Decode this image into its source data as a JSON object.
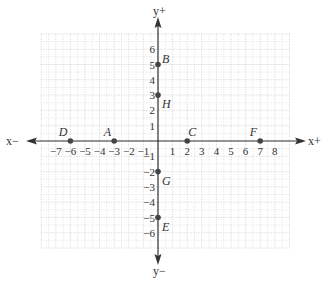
{
  "chart_data": {
    "type": "scatter",
    "title": "",
    "xlabel_pos": "x+",
    "xlabel_neg": "x−",
    "ylabel_pos": "y+",
    "ylabel_neg": "y−",
    "xlim": [
      -8,
      9
    ],
    "ylim": [
      -7,
      7
    ],
    "grid": true,
    "x_ticks": [
      -7,
      -6,
      -5,
      -4,
      -3,
      -2,
      -1,
      1,
      2,
      3,
      4,
      5,
      6,
      7,
      8
    ],
    "y_ticks": [
      -6,
      -5,
      -4,
      -3,
      -2,
      -1,
      1,
      2,
      3,
      4,
      5,
      6
    ],
    "points": [
      {
        "label": "A",
        "x": -3,
        "y": 0
      },
      {
        "label": "B",
        "x": 0,
        "y": 5
      },
      {
        "label": "C",
        "x": 2,
        "y": 0
      },
      {
        "label": "D",
        "x": -6,
        "y": 0
      },
      {
        "label": "E",
        "x": 0,
        "y": -5
      },
      {
        "label": "F",
        "x": 7,
        "y": 0
      },
      {
        "label": "G",
        "x": 0,
        "y": -2
      },
      {
        "label": "H",
        "x": 0,
        "y": 3
      }
    ]
  },
  "colors": {
    "axis": "#333333",
    "grid": "#c8c8c8",
    "point": "#444444",
    "text": "#333333"
  }
}
